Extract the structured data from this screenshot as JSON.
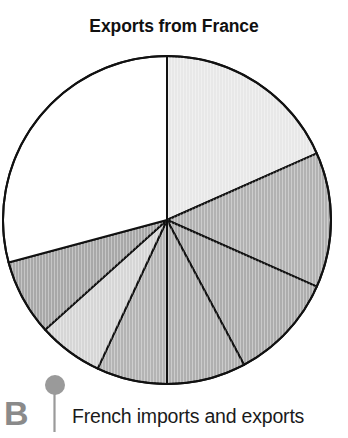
{
  "figure": {
    "section_letter": "B",
    "caption": "French imports and exports",
    "marker_icon": "pin-marker-icon",
    "marker_color": "#9a9a9a"
  },
  "chart_data": {
    "type": "pie",
    "title": "Exports from France",
    "subtitle": "",
    "xlabel": "",
    "ylabel": "",
    "grid": false,
    "legend_position": "none",
    "start_angle_deg": 0,
    "direction": "clockwise",
    "center": {
      "x": 167,
      "y": 220,
      "radius": 164
    },
    "outline_color": "#111111",
    "outline_width": 2,
    "total_degrees": 360,
    "categories": [
      "Slice 1",
      "Slice 2",
      "Slice 3",
      "Slice 4",
      "Slice 5",
      "Slice 6",
      "Slice 7",
      "Slice 8"
    ],
    "values": [
      66,
      48,
      38,
      28,
      25,
      23,
      27,
      105
    ],
    "percentages": [
      18.3,
      13.3,
      10.6,
      7.8,
      6.9,
      6.4,
      7.5,
      29.2
    ],
    "slices": [
      {
        "label": "Slice 1",
        "start_deg": 0,
        "end_deg": 66,
        "degrees": 66,
        "percent": 18.3,
        "color": "#e8e8e8",
        "texture": "vertical-hatch"
      },
      {
        "label": "Slice 2",
        "start_deg": 66,
        "end_deg": 114,
        "degrees": 48,
        "percent": 13.3,
        "color": "#b2b2b2",
        "texture": "vertical-hatch"
      },
      {
        "label": "Slice 3",
        "start_deg": 114,
        "end_deg": 152,
        "degrees": 38,
        "percent": 10.6,
        "color": "#adadad",
        "texture": "vertical-hatch"
      },
      {
        "label": "Slice 4",
        "start_deg": 152,
        "end_deg": 180,
        "degrees": 28,
        "percent": 7.8,
        "color": "#b0b0b0",
        "texture": "vertical-hatch"
      },
      {
        "label": "Slice 5",
        "start_deg": 180,
        "end_deg": 205,
        "degrees": 25,
        "percent": 6.9,
        "color": "#b4b4b4",
        "texture": "vertical-hatch"
      },
      {
        "label": "Slice 6",
        "start_deg": 205,
        "end_deg": 228,
        "degrees": 23,
        "percent": 6.4,
        "color": "#d6d6d6",
        "texture": "vertical-hatch"
      },
      {
        "label": "Slice 7",
        "start_deg": 228,
        "end_deg": 255,
        "degrees": 27,
        "percent": 7.5,
        "color": "#a8a8a8",
        "texture": "vertical-hatch"
      },
      {
        "label": "Slice 8",
        "start_deg": 255,
        "end_deg": 360,
        "degrees": 105,
        "percent": 29.2,
        "color": "#ffffff",
        "texture": "none"
      }
    ]
  }
}
